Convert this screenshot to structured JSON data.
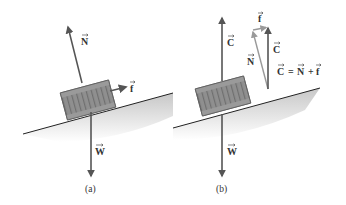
{
  "figure": {
    "panels": [
      {
        "id": "a",
        "caption": "(a)",
        "vectors": [
          {
            "name": "normal-force",
            "label": "N"
          },
          {
            "name": "friction-force",
            "label": "f"
          },
          {
            "name": "weight",
            "label": "W"
          }
        ]
      },
      {
        "id": "b",
        "caption": "(b)",
        "vectors": [
          {
            "name": "contact-force",
            "label": "C"
          },
          {
            "name": "weight",
            "label": "W"
          }
        ],
        "vector_triangle": {
          "labels": {
            "f": "f",
            "N": "N",
            "C": "C"
          },
          "equation": {
            "lhs": "C",
            "eq": "=",
            "n": "N",
            "plus": "+",
            "f": "f"
          }
        }
      }
    ]
  },
  "colors": {
    "arrow": "#555555",
    "arrow_light": "#999999",
    "block": "#8a8a8a",
    "block_dark": "#6e6e6e",
    "incline": "#222222",
    "shadow": "#cfcfcf",
    "text": "#333333"
  }
}
